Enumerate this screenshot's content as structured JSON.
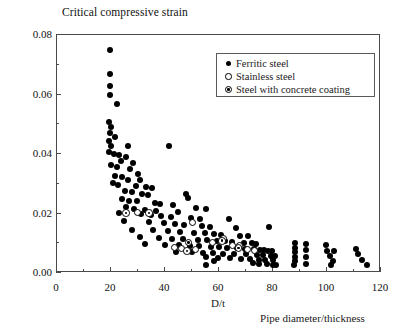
{
  "chart_data": {
    "type": "scatter",
    "title": "Critical compressive strain",
    "xlabel": "D/t",
    "xlabel_secondary": "Pipe diameter/thickness",
    "ylabel": "",
    "xlim": [
      0,
      120
    ],
    "ylim": [
      0,
      0.08
    ],
    "xticks": [
      0,
      20,
      40,
      60,
      80,
      100,
      120
    ],
    "xtick_labels": [
      "0",
      "20",
      "40",
      "60",
      "80",
      "100",
      "120"
    ],
    "x_minor_ticks": [
      10,
      30,
      50,
      70,
      90,
      110
    ],
    "yticks": [
      0,
      0.02,
      0.04,
      0.06,
      0.08
    ],
    "ytick_labels": [
      "0.00",
      "0.02",
      "0.04",
      "0.06",
      "0.08"
    ],
    "y_minor_ticks": [
      0.01,
      0.03,
      0.05,
      0.07
    ],
    "grid": false,
    "legend_position": "top-right",
    "series": [
      {
        "name": "Ferritic steel",
        "marker": "filled-circle",
        "color": "#000000",
        "points": [
          [
            20.0,
            0.0745
          ],
          [
            20.0,
            0.0665
          ],
          [
            20.0,
            0.0625
          ],
          [
            20.0,
            0.0595
          ],
          [
            22.5,
            0.0565
          ],
          [
            19.8,
            0.0505
          ],
          [
            20.2,
            0.0488
          ],
          [
            20.0,
            0.0468
          ],
          [
            22.0,
            0.0455
          ],
          [
            19.6,
            0.044
          ],
          [
            20.4,
            0.0425
          ],
          [
            26.5,
            0.0425
          ],
          [
            19.8,
            0.0405
          ],
          [
            21.5,
            0.0398
          ],
          [
            23.5,
            0.0392
          ],
          [
            26.0,
            0.0385
          ],
          [
            42.0,
            0.0425
          ],
          [
            24.0,
            0.0372
          ],
          [
            28.5,
            0.0368
          ],
          [
            20.5,
            0.036
          ],
          [
            22.5,
            0.0352
          ],
          [
            27.5,
            0.0345
          ],
          [
            30.5,
            0.033
          ],
          [
            22.0,
            0.0322
          ],
          [
            24.5,
            0.0318
          ],
          [
            26.5,
            0.031
          ],
          [
            31.0,
            0.0308
          ],
          [
            21.0,
            0.03
          ],
          [
            23.0,
            0.0292
          ],
          [
            29.5,
            0.0288
          ],
          [
            33.5,
            0.0285
          ],
          [
            35.5,
            0.0282
          ],
          [
            25.5,
            0.0272
          ],
          [
            28.0,
            0.0268
          ],
          [
            32.0,
            0.0262
          ],
          [
            34.0,
            0.0258
          ],
          [
            48.0,
            0.0262
          ],
          [
            49.0,
            0.0248
          ],
          [
            24.5,
            0.0245
          ],
          [
            27.0,
            0.024
          ],
          [
            30.0,
            0.0238
          ],
          [
            36.5,
            0.0232
          ],
          [
            38.5,
            0.0228
          ],
          [
            43.5,
            0.0225
          ],
          [
            26.0,
            0.0218
          ],
          [
            29.0,
            0.0212
          ],
          [
            33.0,
            0.0208
          ],
          [
            37.0,
            0.0205
          ],
          [
            45.0,
            0.0202
          ],
          [
            52.0,
            0.0215
          ],
          [
            55.5,
            0.0212
          ],
          [
            23.5,
            0.0198
          ],
          [
            31.5,
            0.0195
          ],
          [
            35.0,
            0.0192
          ],
          [
            39.0,
            0.0188
          ],
          [
            42.5,
            0.0185
          ],
          [
            50.0,
            0.0182
          ],
          [
            53.5,
            0.0178
          ],
          [
            64.0,
            0.0178
          ],
          [
            25.0,
            0.0172
          ],
          [
            34.5,
            0.0168
          ],
          [
            40.0,
            0.0165
          ],
          [
            44.0,
            0.0162
          ],
          [
            47.5,
            0.0158
          ],
          [
            54.0,
            0.0155
          ],
          [
            57.0,
            0.0152
          ],
          [
            66.5,
            0.0148
          ],
          [
            79.0,
            0.0152
          ],
          [
            28.0,
            0.0142
          ],
          [
            36.0,
            0.014
          ],
          [
            41.5,
            0.0138
          ],
          [
            46.0,
            0.0135
          ],
          [
            51.0,
            0.0132
          ],
          [
            55.0,
            0.013
          ],
          [
            58.5,
            0.0128
          ],
          [
            61.0,
            0.0125
          ],
          [
            68.0,
            0.0122
          ],
          [
            71.0,
            0.012
          ],
          [
            31.0,
            0.0118
          ],
          [
            38.0,
            0.0115
          ],
          [
            43.0,
            0.0112
          ],
          [
            47.0,
            0.011
          ],
          [
            52.5,
            0.0108
          ],
          [
            56.0,
            0.0106
          ],
          [
            59.5,
            0.0105
          ],
          [
            62.5,
            0.0103
          ],
          [
            65.0,
            0.01
          ],
          [
            69.5,
            0.0098
          ],
          [
            72.5,
            0.0096
          ],
          [
            74.0,
            0.0095
          ],
          [
            33.0,
            0.0095
          ],
          [
            40.5,
            0.0092
          ],
          [
            45.5,
            0.009
          ],
          [
            49.5,
            0.0088
          ],
          [
            53.0,
            0.0086
          ],
          [
            57.5,
            0.0085
          ],
          [
            60.5,
            0.0083
          ],
          [
            63.5,
            0.0082
          ],
          [
            67.0,
            0.008
          ],
          [
            70.0,
            0.0078
          ],
          [
            73.5,
            0.0077
          ],
          [
            75.5,
            0.0075
          ],
          [
            77.0,
            0.0074
          ],
          [
            78.5,
            0.0072
          ],
          [
            80.0,
            0.007
          ],
          [
            44.5,
            0.0068
          ],
          [
            50.5,
            0.0066
          ],
          [
            54.5,
            0.0065
          ],
          [
            58.0,
            0.0064
          ],
          [
            62.0,
            0.0062
          ],
          [
            66.0,
            0.006
          ],
          [
            70.5,
            0.0059
          ],
          [
            74.5,
            0.0058
          ],
          [
            76.5,
            0.0056
          ],
          [
            79.5,
            0.0055
          ],
          [
            81.0,
            0.0054
          ],
          [
            55.5,
            0.005
          ],
          [
            60.0,
            0.0048
          ],
          [
            64.5,
            0.0047
          ],
          [
            68.5,
            0.0045
          ],
          [
            72.0,
            0.0044
          ],
          [
            75.0,
            0.0042
          ],
          [
            77.5,
            0.0041
          ],
          [
            80.5,
            0.004
          ],
          [
            73.0,
            0.003
          ],
          [
            75.0,
            0.0028
          ],
          [
            78.0,
            0.0026
          ],
          [
            80.5,
            0.0024
          ],
          [
            81.5,
            0.0022
          ],
          [
            88.5,
            0.0098
          ],
          [
            88.5,
            0.0082
          ],
          [
            88.5,
            0.0068
          ],
          [
            88.5,
            0.0052
          ],
          [
            88.5,
            0.0038
          ],
          [
            88.0,
            0.0024
          ],
          [
            92.5,
            0.0095
          ],
          [
            92.5,
            0.0074
          ],
          [
            92.5,
            0.005
          ],
          [
            92.5,
            0.0026
          ],
          [
            100.0,
            0.0092
          ],
          [
            100.5,
            0.0072
          ],
          [
            101.5,
            0.0055
          ],
          [
            103.0,
            0.0072
          ],
          [
            102.5,
            0.0038
          ],
          [
            102.0,
            0.0024
          ],
          [
            111.0,
            0.0078
          ],
          [
            112.0,
            0.006
          ],
          [
            113.5,
            0.004
          ],
          [
            115.0,
            0.0022
          ],
          [
            55.5,
            0.0022
          ],
          [
            58.5,
            0.0038
          ]
        ]
      },
      {
        "name": "Stainless steel",
        "marker": "open-circle",
        "color": "#000000",
        "points": [
          [
            30.0,
            0.02
          ],
          [
            50.5,
            0.0168
          ],
          [
            62.0,
            0.0112
          ],
          [
            58.0,
            0.0098
          ],
          [
            65.5,
            0.0088
          ],
          [
            68.0,
            0.009
          ],
          [
            46.5,
            0.0078
          ],
          [
            51.5,
            0.0076
          ],
          [
            71.0,
            0.0074
          ],
          [
            73.5,
            0.0072
          ],
          [
            44.0,
            0.0082
          ]
        ]
      },
      {
        "name": "Steel with concrete coating",
        "marker": "dotted-circle",
        "color": "#000000",
        "points": [
          [
            26.0,
            0.0198
          ],
          [
            34.5,
            0.0198
          ],
          [
            49.0,
            0.01
          ],
          [
            48.5,
            0.007
          ],
          [
            67.5,
            0.008
          ],
          [
            61.5,
            0.0105
          ]
        ]
      }
    ]
  },
  "legend": {
    "entries": [
      {
        "label": "Ferritic steel",
        "marker": "filled-circle"
      },
      {
        "label": "Stainless steel",
        "marker": "open-circle"
      },
      {
        "label": "Steel with concrete coating",
        "marker": "dotted-circle"
      }
    ]
  }
}
